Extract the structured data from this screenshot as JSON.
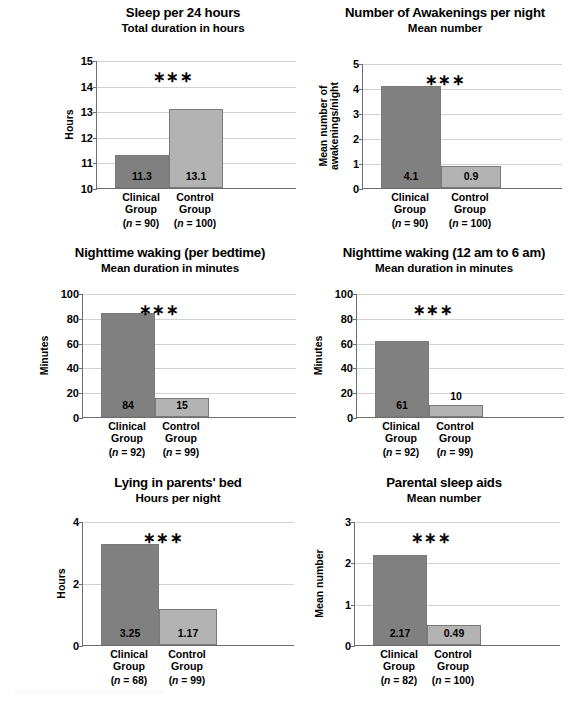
{
  "figure": {
    "width": 582,
    "height": 703,
    "background": "#ffffff",
    "colors": {
      "clinical_bar": "#808080",
      "control_bar": "#b3b3b3",
      "bar_border": "#7a7a7a",
      "axis": "#6e6e6e",
      "gridline": "#d2d2d2",
      "text": "#000000"
    },
    "significance_marker": "∗∗∗"
  },
  "chart_data": [
    {
      "id": "sleep-per-24-hours",
      "type": "bar",
      "title": "Sleep per 24 hours",
      "subtitle": "Total duration in hours",
      "xlabel": "",
      "ylabel": "Hours",
      "ylim": [
        10,
        15
      ],
      "yticks": [
        10,
        11,
        12,
        13,
        14,
        15
      ],
      "ytick_labels": [
        "10",
        "11",
        "12",
        "13",
        "14",
        "15"
      ],
      "grid": true,
      "categories": [
        "Clinical Group",
        "Control Group"
      ],
      "category_lines": [
        [
          "Clinical",
          "Group"
        ],
        [
          "Control",
          "Group"
        ]
      ],
      "n_labels": [
        "(n = 90)",
        "(n = 100)"
      ],
      "n_values": [
        90,
        100
      ],
      "values": [
        11.3,
        13.1
      ],
      "value_labels": [
        "11.3",
        "13.1"
      ],
      "annotation": "∗∗∗",
      "annotation_label": "***"
    },
    {
      "id": "number-of-awakenings-per-night",
      "type": "bar",
      "title": "Number of Awakenings per night",
      "subtitle": "Mean number",
      "xlabel": "",
      "ylabel": "Mean number of awakenings/night",
      "ylabel_lines": [
        "Mean number of",
        "awakenings/night"
      ],
      "ylim": [
        0,
        5
      ],
      "yticks": [
        0,
        1,
        2,
        3,
        4,
        5
      ],
      "ytick_labels": [
        "0",
        "1",
        "2",
        "3",
        "4",
        "5"
      ],
      "grid": true,
      "categories": [
        "Clinical Group",
        "Control Group"
      ],
      "category_lines": [
        [
          "Clinical",
          "Group"
        ],
        [
          "Control",
          "Group"
        ]
      ],
      "n_labels": [
        "(n = 90)",
        "(n = 100)"
      ],
      "n_values": [
        90,
        100
      ],
      "values": [
        4.1,
        0.9
      ],
      "value_labels": [
        "4.1",
        "0.9"
      ],
      "annotation": "∗∗∗",
      "annotation_label": "***"
    },
    {
      "id": "nighttime-waking-per-bedtime",
      "type": "bar",
      "title": "Nighttime waking (per bedtime)",
      "subtitle": "Mean duration in minutes",
      "xlabel": "",
      "ylabel": "Minutes",
      "ylim": [
        0,
        100
      ],
      "yticks": [
        0,
        20,
        40,
        60,
        80,
        100
      ],
      "ytick_labels": [
        "0",
        "20",
        "40",
        "60",
        "80",
        "100"
      ],
      "grid": true,
      "categories": [
        "Clinical Group",
        "Control Group"
      ],
      "category_lines": [
        [
          "Clinical",
          "Group"
        ],
        [
          "Control",
          "Group"
        ]
      ],
      "n_labels": [
        "(n = 92)",
        "(n = 99)"
      ],
      "n_values": [
        92,
        99
      ],
      "values": [
        84,
        15
      ],
      "value_labels": [
        "84",
        "15"
      ],
      "annotation": "∗∗∗",
      "annotation_label": "***"
    },
    {
      "id": "nighttime-waking-12am-to-6am",
      "type": "bar",
      "title": "Nighttime waking (12 am to 6 am)",
      "subtitle": "Mean duration in minutes",
      "xlabel": "",
      "ylabel": "Minutes",
      "ylim": [
        0,
        100
      ],
      "yticks": [
        0,
        20,
        40,
        60,
        80,
        100
      ],
      "ytick_labels": [
        "0",
        "20",
        "40",
        "60",
        "80",
        "100"
      ],
      "grid": true,
      "categories": [
        "Clinical Group",
        "Control Group"
      ],
      "category_lines": [
        [
          "Clinical",
          "Group"
        ],
        [
          "Control",
          "Group"
        ]
      ],
      "n_labels": [
        "(n = 92)",
        "(n = 99)"
      ],
      "n_values": [
        92,
        99
      ],
      "values": [
        61,
        10
      ],
      "value_labels": [
        "61",
        "10"
      ],
      "annotation": "∗∗∗",
      "annotation_label": "***"
    },
    {
      "id": "lying-in-parents-bed",
      "type": "bar",
      "title": "Lying in parents' bed",
      "subtitle": "Hours per night",
      "xlabel": "",
      "ylabel": "Hours",
      "ylim": [
        0,
        4
      ],
      "yticks": [
        0,
        2,
        4
      ],
      "ytick_labels": [
        "0",
        "2",
        "4"
      ],
      "grid": true,
      "categories": [
        "Clinical Group",
        "Control Group"
      ],
      "category_lines": [
        [
          "Clinical",
          "Group"
        ],
        [
          "Control",
          "Group"
        ]
      ],
      "n_labels": [
        "(n = 68)",
        "(n = 99)"
      ],
      "n_values": [
        68,
        99
      ],
      "values": [
        3.25,
        1.17
      ],
      "value_labels": [
        "3.25",
        "1.17"
      ],
      "annotation": "∗∗∗",
      "annotation_label": "***"
    },
    {
      "id": "parental-sleep-aids",
      "type": "bar",
      "title": "Parental sleep aids",
      "subtitle": "Mean number",
      "xlabel": "",
      "ylabel": "Mean number",
      "ylim": [
        0,
        3
      ],
      "yticks": [
        0,
        1,
        2,
        3
      ],
      "ytick_labels": [
        "0",
        "1",
        "2",
        "3"
      ],
      "grid": true,
      "categories": [
        "Clinical Group",
        "Control Group"
      ],
      "category_lines": [
        [
          "Clinical",
          "Group"
        ],
        [
          "Control",
          "Group"
        ]
      ],
      "n_labels": [
        "(n = 82)",
        "(n = 100)"
      ],
      "n_values": [
        82,
        100
      ],
      "values": [
        2.17,
        0.49
      ],
      "value_labels": [
        "2.17",
        "0.49"
      ],
      "annotation": "∗∗∗",
      "annotation_label": "***"
    }
  ]
}
